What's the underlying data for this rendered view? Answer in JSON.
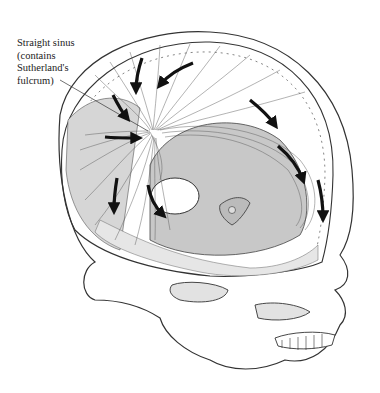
{
  "figure": {
    "label": {
      "lines": [
        "Straight sinus",
        "(contains",
        "Sutherland's",
        "fulcrum)"
      ]
    },
    "arrows_count": 9,
    "colors": {
      "line": "#333333",
      "shade_light": "#e6e6e6",
      "shade_mid": "#c8c8c8",
      "background": "#ffffff"
    }
  }
}
